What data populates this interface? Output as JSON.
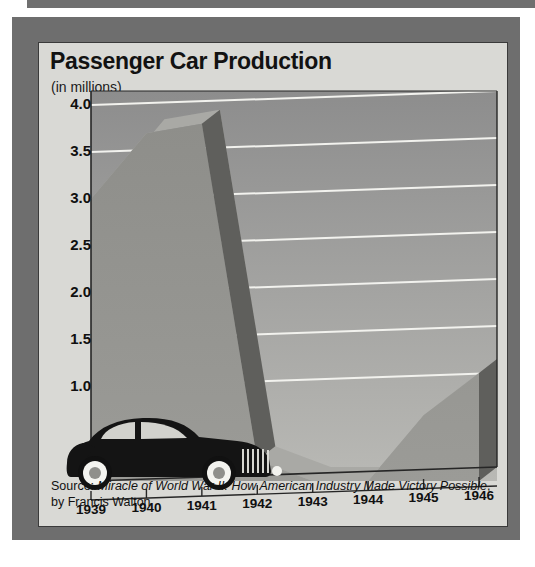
{
  "figure": {
    "title": "Passenger Car Production",
    "subtitle": "(in millions)",
    "source_prefix": "Source: ",
    "source_title": "Miracle of World War II: How American Industry Made Victory Possible",
    "source_suffix": ", by Francis Walton",
    "decorations": {
      "car": "vintage-sedan-silhouette"
    }
  },
  "colors": {
    "frame": "#6e6e6e",
    "card_bg": "#d9d9d5",
    "plot_bg_top": "#8d8d8d",
    "plot_bg_bottom": "#b9b9b5",
    "area_top_face": "#a9a9a5",
    "area_front_face": "#8a8a86",
    "area_side_face": "#5f5f5c",
    "gridline": "#f2f2ee",
    "axis": "#262626",
    "text": "#111111",
    "car": "#141414"
  },
  "chart_data": {
    "type": "area",
    "title": "Passenger Car Production",
    "subtitle": "(in millions)",
    "xlabel": "",
    "ylabel": "",
    "unit": "millions of cars",
    "grid": true,
    "legend": "none",
    "style": "3d-ribbon-area",
    "categories": [
      "1939",
      "1940",
      "1941",
      "1942",
      "1943",
      "1944",
      "1945",
      "1946"
    ],
    "x": [
      1939,
      1940,
      1941,
      1942,
      1943,
      1944,
      1945,
      1946
    ],
    "values": [
      3.0,
      3.7,
      3.8,
      0.22,
      0.0,
      0.0,
      0.7,
      1.15
    ],
    "xlim": [
      1939,
      1946
    ],
    "ylim": [
      0,
      4.0
    ],
    "yticks": [
      "4.0",
      "3.5",
      "3.0",
      "2.5",
      "2.0",
      "1.5",
      "1.0",
      "0"
    ],
    "ytick_values": [
      4.0,
      3.5,
      3.0,
      2.5,
      2.0,
      1.5,
      1.0,
      0
    ],
    "xticks": [
      "1939",
      "1940",
      "1941",
      "1942",
      "1943",
      "1944",
      "1945",
      "1946"
    ],
    "annotations": []
  }
}
